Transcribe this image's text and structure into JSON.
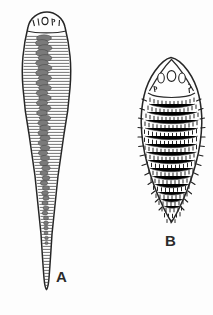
{
  "figure": {
    "kind": "scientific-line-drawing",
    "medium": "ink drawing on white page",
    "background_color": "#fdfdfd",
    "ink_color": "#262626",
    "width_px": 213,
    "height_px": 315,
    "specimens": [
      {
        "label": "A",
        "label_x": 56,
        "label_y": 269,
        "shape": "elongate club-shaped body tapering to a long pointed tail",
        "bounds": {
          "x": 18,
          "y": 12,
          "width": 58,
          "height": 278
        },
        "widest_y": 72,
        "head": {
          "description": "rounded dome-shaped head cap bearing a transverse row of small sensory structures",
          "marks": [
            "1",
            "1",
            "o",
            "r",
            "1"
          ],
          "mark_count": 5
        },
        "body": {
          "pattern": "dense horizontal transverse striations (annulations) across full body",
          "striation_count": 84,
          "interior_feature": "dark granular central column (gut / intestine) running from below head to tail"
        },
        "tail": "long slender tapering point"
      },
      {
        "label": "B",
        "label_x": 165,
        "label_y": 233,
        "shape": "broad ovate body, widest above middle, tapering to a blunt rounded base",
        "bounds": {
          "x": 140,
          "y": 57,
          "width": 61,
          "height": 175
        },
        "widest_y": 118,
        "head": {
          "description": "triangular-conical head shield with a row of oval structures",
          "marks": [
            "p",
            "o",
            "p",
            "a"
          ],
          "mark_count": 4
        },
        "body": {
          "pattern": "curved transverse bands of short vertical dashes (scale / spine rows)",
          "band_count": 17,
          "margin": "marginal spines projecting outward along both lateral edges"
        },
        "base": "blunt rounded posterior end"
      }
    ]
  }
}
